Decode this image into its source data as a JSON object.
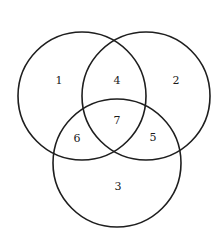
{
  "diagram": {
    "type": "venn",
    "sets": 3,
    "circles": [
      {
        "id": "left",
        "cx": 82,
        "cy": 96,
        "r": 64
      },
      {
        "id": "right",
        "cx": 146,
        "cy": 96,
        "r": 64
      },
      {
        "id": "bottom",
        "cx": 117,
        "cy": 163,
        "r": 64
      }
    ],
    "regions": [
      {
        "label": "1",
        "x": 59,
        "y": 80,
        "description": "left only"
      },
      {
        "label": "2",
        "x": 176,
        "y": 80,
        "description": "right only"
      },
      {
        "label": "3",
        "x": 118,
        "y": 186,
        "description": "bottom only"
      },
      {
        "label": "4",
        "x": 117,
        "y": 80,
        "description": "left and right"
      },
      {
        "label": "5",
        "x": 153,
        "y": 137,
        "description": "right and bottom"
      },
      {
        "label": "6",
        "x": 77,
        "y": 138,
        "description": "left and bottom"
      },
      {
        "label": "7",
        "x": 117,
        "y": 120,
        "description": "all three"
      }
    ],
    "stroke_color": "#1e1e1e",
    "background": "#ffffff"
  }
}
